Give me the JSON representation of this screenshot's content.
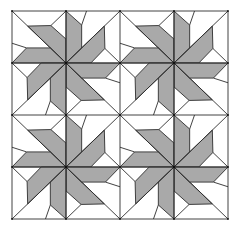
{
  "diagram": {
    "title": "",
    "type": "quilt-pattern",
    "canvas": {
      "width": 235,
      "height": 227
    },
    "origin": {
      "x": 12,
      "y": 11
    },
    "blocks": {
      "cols": 2,
      "rows": 2,
      "block_width": 108,
      "block_height": 104
    },
    "colors": {
      "background": "#ffffff",
      "blade_fill": "#a9a9a9",
      "patch_fill": "#ffffff",
      "stroke": "#2e2e2e",
      "vertex_dot": "#111111"
    },
    "stroke_width": 0.9,
    "cell_template": {
      "note": "Geometry for the top-left cell of a block in block units (block spans 0..2 x 0..2, center at 1,1). Other three cells are 90-degree clockwise rotations about the center.",
      "blades": [
        [
          [
            0.29,
            0.29
          ],
          [
            0.72,
            0.28
          ],
          [
            1.0,
            0.54
          ],
          [
            1.0,
            1.0
          ]
        ],
        [
          [
            0.0,
            1.0
          ],
          [
            0.27,
            0.71
          ],
          [
            0.71,
            0.71
          ],
          [
            1.0,
            1.0
          ]
        ]
      ],
      "lines": [
        [
          [
            0.0,
            0.0
          ],
          [
            1.0,
            1.0
          ]
        ],
        [
          [
            0.72,
            0.28
          ],
          [
            1.0,
            0.0
          ]
        ],
        [
          [
            0.0,
            0.62
          ],
          [
            0.27,
            0.71
          ]
        ]
      ]
    }
  }
}
